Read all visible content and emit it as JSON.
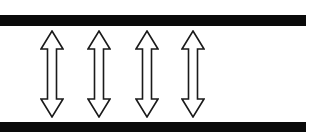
{
  "diagram": {
    "plates": [
      {
        "id": "top",
        "color": "#0a0a0a"
      },
      {
        "id": "bottom",
        "color": "#0a0a0a"
      }
    ],
    "arrows": [
      {
        "icon": "double-headed-vertical-arrow",
        "center_x": 52
      },
      {
        "icon": "double-headed-vertical-arrow",
        "center_x": 99
      },
      {
        "icon": "double-headed-vertical-arrow",
        "center_x": 147
      },
      {
        "icon": "double-headed-vertical-arrow",
        "center_x": 193
      }
    ],
    "colors": {
      "background": "#ffffff",
      "stroke": "#1a1a1a",
      "arrow_fill": "#ffffff"
    }
  }
}
